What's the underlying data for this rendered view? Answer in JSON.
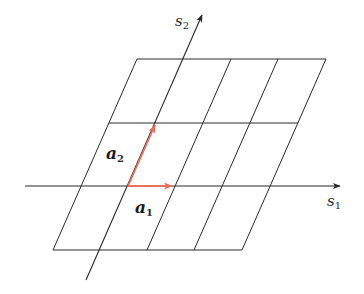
{
  "diagram": {
    "colors": {
      "ink": "#2a2a2a",
      "vector": "#e8705f",
      "background": "#ffffff"
    },
    "axes": {
      "s1": {
        "label": "s",
        "subscript": "1",
        "from": [
          25,
          186
        ],
        "to": [
          340,
          186
        ],
        "label_pos": [
          327,
          206
        ]
      },
      "s2": {
        "label": "s",
        "subscript": "2",
        "from": [
          86,
          280
        ],
        "to": [
          202,
          15
        ],
        "label_pos": [
          175,
          26
        ]
      }
    },
    "grid": {
      "horizontal_lines": [
        {
          "y": 59,
          "x1": 137,
          "x2": 326
        },
        {
          "y": 123,
          "x1": 109,
          "x2": 298
        },
        {
          "y": 250,
          "x1": 53,
          "x2": 242
        }
      ],
      "slanted_lines": [
        {
          "top": [
            137,
            59
          ],
          "bottom": [
            53,
            250
          ]
        },
        {
          "top": [
            231,
            59
          ],
          "bottom": [
            147,
            250
          ]
        },
        {
          "top": [
            278,
            59
          ],
          "bottom": [
            194,
            250
          ]
        },
        {
          "top": [
            326,
            59
          ],
          "bottom": [
            242,
            250
          ]
        }
      ]
    },
    "vectors": [
      {
        "name": "a1",
        "label": "a",
        "subscript": "1",
        "from": [
          128,
          186
        ],
        "to": [
          172,
          186
        ],
        "label_pos": [
          135,
          213
        ]
      },
      {
        "name": "a2",
        "label": "a",
        "subscript": "2",
        "from": [
          128,
          186
        ],
        "to": [
          155,
          125
        ],
        "label_pos": [
          106,
          159
        ]
      }
    ]
  }
}
